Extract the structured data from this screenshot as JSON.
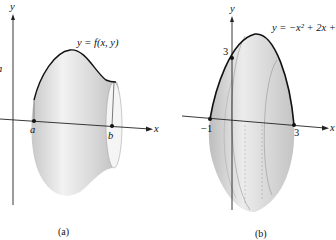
{
  "figures": [
    {
      "id": "a",
      "caption": "(a)",
      "curve_label": "y = f(x, y)",
      "axis_x_label": "x",
      "axis_y_label": "y",
      "point_labels": [
        "a",
        "b"
      ],
      "edge_fragment": "a"
    },
    {
      "id": "b",
      "caption": "(b)",
      "curve_label": "y = −x² + 2x +",
      "axis_x_label": "x",
      "axis_y_label": "y",
      "tick_labels": [
        "−1",
        "3",
        "3"
      ]
    }
  ],
  "colors": {
    "solid_fill": "#d4d4d4",
    "solid_highlight": "#f0f0f0",
    "outline": "#111111",
    "axis": "#222222"
  }
}
